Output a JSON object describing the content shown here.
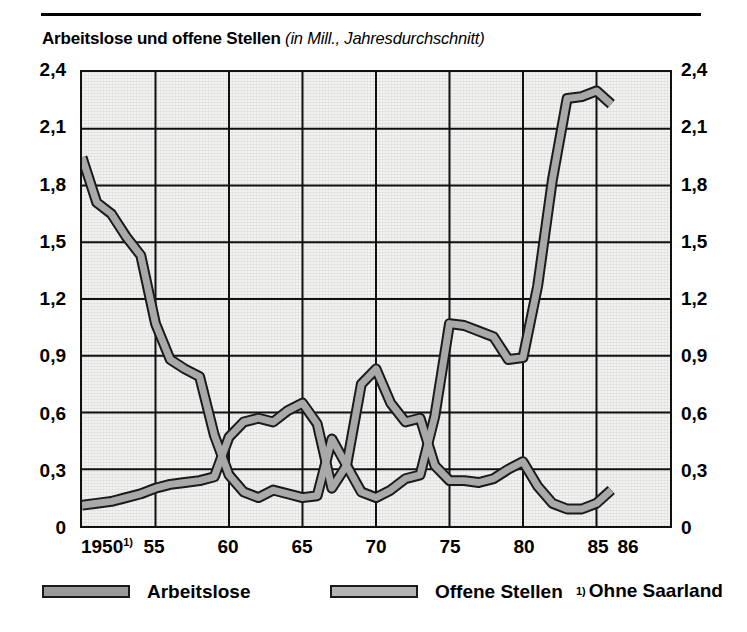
{
  "figure": {
    "title_main": "Arbeitslose und offene Stellen",
    "title_sub": "(in Mill., Jahresdurchschnitt)",
    "footnote_marker": "1)",
    "footnote_text": "Ohne Saarland",
    "series_color": "#a9a9a9",
    "series_outline_color": "#1a1a1a",
    "grid_color": "#111111",
    "plot_background": "#f2f2f1"
  },
  "legend": {
    "items": [
      {
        "label": "Arbeitslose",
        "color": "#9a9a9a"
      },
      {
        "label": "Offene Stellen",
        "color": "#b4b4b4"
      }
    ],
    "note_marker": "1)",
    "note_label": "Ohne Saarland"
  },
  "axes": {
    "y_ticks_left": [
      "2,4",
      "2,1",
      "1,8",
      "1,5",
      "1,2",
      "0,9",
      "0,6",
      "0,3",
      "0"
    ],
    "y_ticks_right": [
      "2,4",
      "2,1",
      "1,8",
      "1,5",
      "1,2",
      "0,9",
      "0,6",
      "0,3",
      "0"
    ],
    "x_ticks": [
      "1950",
      "55",
      "60",
      "65",
      "70",
      "75",
      "80",
      "85",
      "86"
    ],
    "x_first_has_footnote": true
  },
  "chart_data": {
    "type": "line",
    "title": "Arbeitslose und offene Stellen (in Mill., Jahresdurchschnitt)",
    "xlabel": "",
    "ylabel": "Mill.",
    "xlim": [
      1950,
      1986
    ],
    "ylim": [
      0,
      2.4
    ],
    "yticks": [
      0,
      0.3,
      0.6,
      0.9,
      1.2,
      1.5,
      1.8,
      2.1,
      2.4
    ],
    "xticks": [
      1950,
      1955,
      1960,
      1965,
      1970,
      1975,
      1980,
      1985,
      1986
    ],
    "grid": true,
    "legend_position": "below",
    "x": [
      1950,
      1951,
      1952,
      1953,
      1954,
      1955,
      1956,
      1957,
      1958,
      1959,
      1960,
      1961,
      1962,
      1963,
      1964,
      1965,
      1966,
      1967,
      1968,
      1969,
      1970,
      1971,
      1972,
      1973,
      1974,
      1975,
      1976,
      1977,
      1978,
      1979,
      1980,
      1981,
      1982,
      1983,
      1984,
      1985,
      1986
    ],
    "series": [
      {
        "name": "Arbeitslose",
        "values": [
          1.95,
          1.71,
          1.65,
          1.53,
          1.43,
          1.07,
          0.88,
          0.83,
          0.79,
          0.48,
          0.27,
          0.18,
          0.15,
          0.19,
          0.17,
          0.15,
          0.16,
          0.46,
          0.32,
          0.18,
          0.15,
          0.19,
          0.25,
          0.27,
          0.58,
          1.07,
          1.06,
          1.03,
          1.0,
          0.88,
          0.89,
          1.27,
          1.83,
          2.26,
          2.27,
          2.3,
          2.23
        ]
      },
      {
        "name": "Offene Stellen",
        "values": [
          0.11,
          0.12,
          0.13,
          0.15,
          0.17,
          0.2,
          0.22,
          0.23,
          0.24,
          0.26,
          0.47,
          0.55,
          0.57,
          0.55,
          0.61,
          0.65,
          0.54,
          0.2,
          0.32,
          0.75,
          0.83,
          0.65,
          0.55,
          0.57,
          0.32,
          0.24,
          0.24,
          0.23,
          0.25,
          0.3,
          0.34,
          0.21,
          0.12,
          0.09,
          0.09,
          0.12,
          0.19
        ]
      }
    ]
  }
}
